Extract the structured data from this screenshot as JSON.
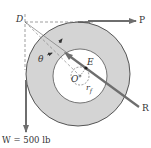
{
  "diagram": {
    "labels": {
      "D": "D",
      "P": "P",
      "theta": "θ",
      "E": "E",
      "O": "O",
      "r": "r",
      "r_sub": "f",
      "R": "R",
      "W": "W = 500 lb"
    },
    "colors": {
      "ring_fill": "#d4d4d4",
      "ring_stroke": "#555555",
      "force_line": "#6e6e6e",
      "dashed": "#777777",
      "background": "#ffffff"
    }
  }
}
